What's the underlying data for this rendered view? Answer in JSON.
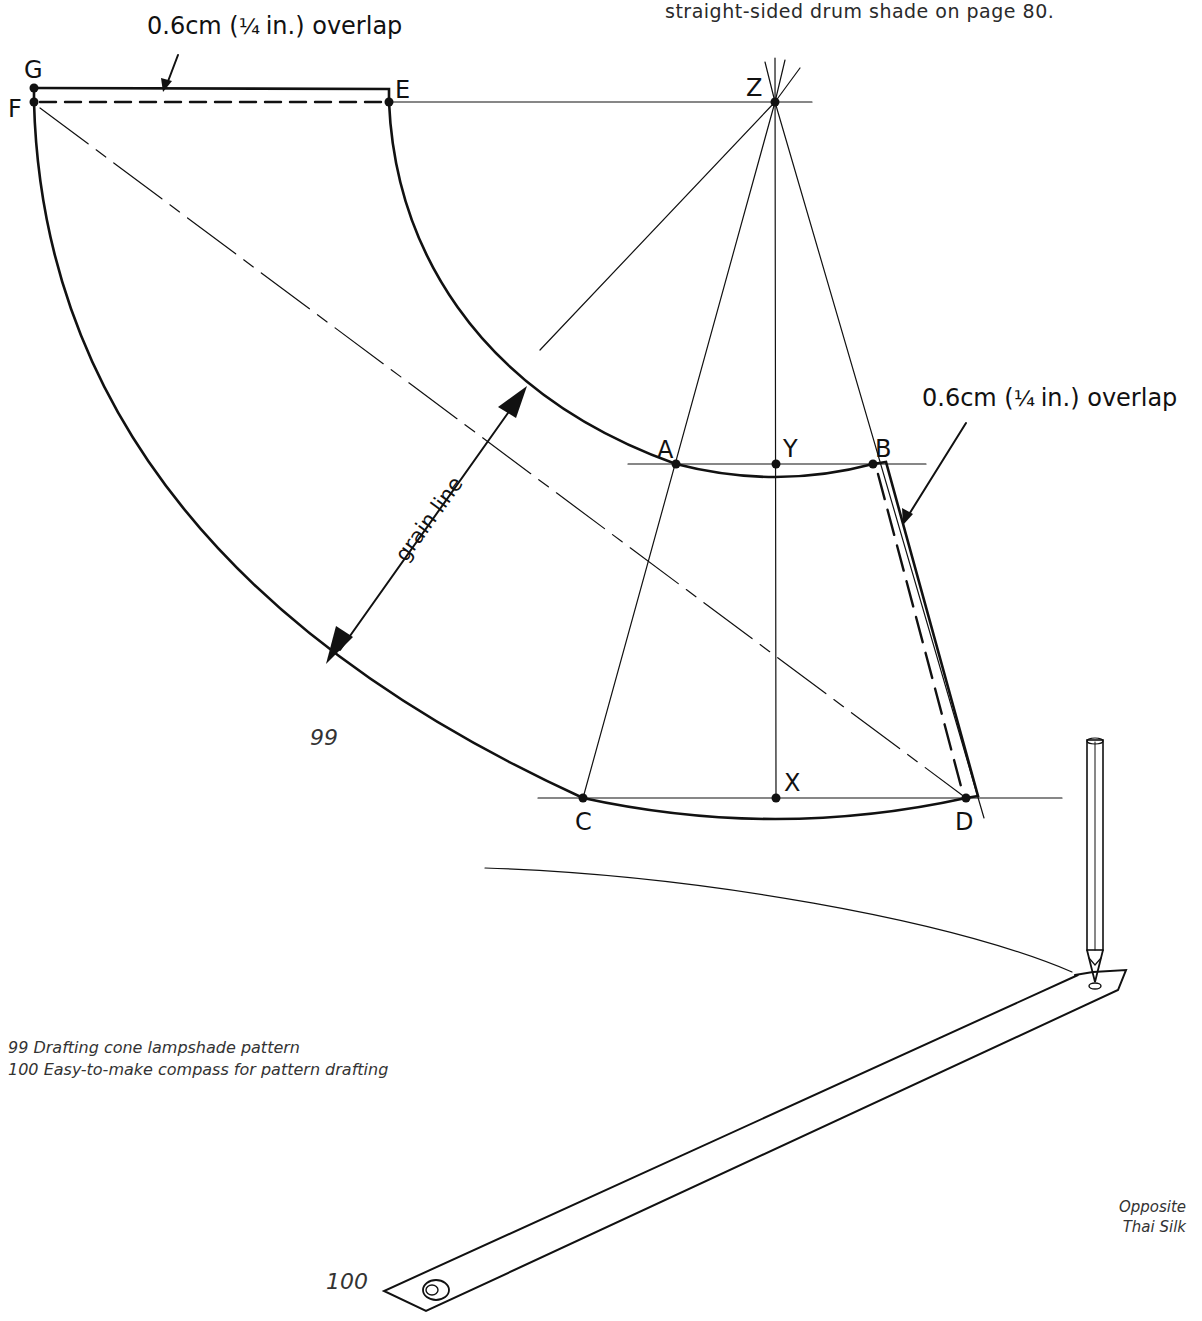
{
  "page": {
    "intro_text_line": "straight-sided drum shade on page 80.",
    "page_number_partial": "90"
  },
  "figure_99": {
    "number": "99",
    "caption": "99  Drafting cone lampshade pattern",
    "callout_top": {
      "prefix": "0.6cm (",
      "fraction": "¼",
      "suffix": " in.) overlap"
    },
    "callout_right": {
      "prefix": "0.6cm (",
      "fraction": "¼",
      "suffix": " in.) overlap"
    },
    "grain_line_label": "grain line",
    "points": {
      "G": {
        "label": "G",
        "x": 34,
        "y": 88
      },
      "F": {
        "label": "F",
        "x": 34,
        "y": 102
      },
      "E": {
        "label": "E",
        "x": 389,
        "y": 102
      },
      "Z": {
        "label": "Z",
        "x": 775,
        "y": 102
      },
      "A": {
        "label": "A",
        "x": 676,
        "y": 464
      },
      "Y": {
        "label": "Y",
        "x": 776,
        "y": 464
      },
      "B": {
        "label": "B",
        "x": 873,
        "y": 464
      },
      "C": {
        "label": "C",
        "x": 583,
        "y": 798
      },
      "X": {
        "label": "X",
        "x": 776,
        "y": 798
      },
      "D": {
        "label": "D",
        "x": 966,
        "y": 798
      }
    }
  },
  "figure_100": {
    "number": "100",
    "caption": "100  Easy-to-make compass for pattern drafting"
  },
  "side_note": {
    "line1": "Opposite",
    "line2": "Thai Silk"
  },
  "colors": {
    "ink": "#111111",
    "paper": "#ffffff",
    "caption_text": "#333333"
  }
}
